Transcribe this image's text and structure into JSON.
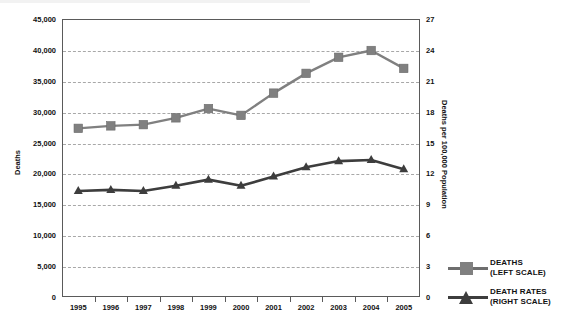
{
  "chart_data": {
    "type": "line",
    "title": "",
    "subtitle": "",
    "xlabel": "",
    "ylabel": "Deaths",
    "y2label": "Deaths per 100,000 Population",
    "categories": [
      "1995",
      "1996",
      "1997",
      "1998",
      "1999",
      "2000",
      "2001",
      "2002",
      "2003",
      "2004",
      "2005"
    ],
    "x": [
      1995,
      1996,
      1997,
      1998,
      1999,
      2000,
      2001,
      2002,
      2003,
      2004,
      2005
    ],
    "ylim": [
      0,
      45000
    ],
    "y2lim": [
      0,
      27
    ],
    "yticks": [
      "0",
      "5,000",
      "10,000",
      "15,000",
      "20,000",
      "25,000",
      "30,000",
      "35,000",
      "40,000",
      "45,000"
    ],
    "ytick_values": [
      0,
      5000,
      10000,
      15000,
      20000,
      25000,
      30000,
      35000,
      40000,
      45000
    ],
    "y2ticks": [
      "0",
      "3",
      "6",
      "9",
      "12",
      "15",
      "18",
      "21",
      "24",
      "27"
    ],
    "y2tick_values": [
      0,
      3,
      6,
      9,
      12,
      15,
      18,
      21,
      24,
      27
    ],
    "grid": true,
    "grid_style": "dashed-horizontal",
    "legend_position": "right",
    "series": [
      {
        "name": "DEATHS (LEFT SCALE)",
        "axis": "left",
        "marker": "square",
        "color": "#808080",
        "values": [
          27300,
          27700,
          27900,
          29000,
          30500,
          29400,
          33000,
          36200,
          38800,
          39900,
          37000
        ]
      },
      {
        "name": "DEATH RATES (RIGHT SCALE)",
        "axis": "right",
        "marker": "triangle",
        "color": "#3d3d3d",
        "values": [
          10.3,
          10.4,
          10.3,
          10.8,
          11.4,
          10.8,
          11.7,
          12.6,
          13.2,
          13.3,
          12.4
        ]
      }
    ]
  },
  "legend": {
    "items": [
      {
        "line1": "DEATHS",
        "line2": "(LEFT SCALE)",
        "marker": "square-marker-icon"
      },
      {
        "line1": "DEATH RATES",
        "line2": "(RIGHT SCALE)",
        "marker": "triangle-marker-icon"
      }
    ]
  },
  "colors": {
    "deaths_series": "#808080",
    "death_rates_series": "#3d3d3d",
    "gridline": "#a8a8a8",
    "axis": "#5a5a5a",
    "text": "#111111",
    "background": "#ffffff"
  }
}
